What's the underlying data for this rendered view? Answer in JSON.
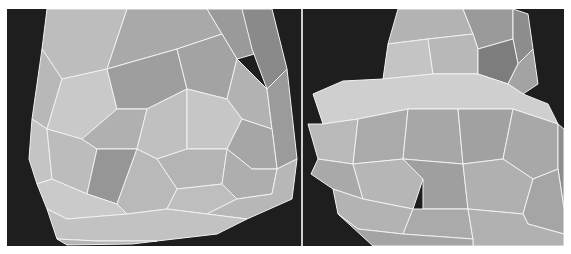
{
  "figure": {
    "background": "#1c1c1c",
    "divider_color": "#cfcfcf",
    "edge_color": "#f2f2f2",
    "panels": [
      {
        "id": "left",
        "description": "lower portion of a tapered polygonal mesh (wireframe over shaded facets)",
        "facets": [
          {
            "points": "40,0 120,0 100,60 55,70 35,40",
            "fill": "#bdbdbd"
          },
          {
            "points": "120,0 200,0 215,25 170,40 100,60",
            "fill": "#a9a9a9"
          },
          {
            "points": "200,0 255,0 265,40 230,50 215,25",
            "fill": "#9a9a9a"
          },
          {
            "points": "235,0 265,0 280,60 260,80 245,40",
            "fill": "#8a8a8a"
          },
          {
            "points": "35,40 55,70 40,120 25,110",
            "fill": "#b8b8b8"
          },
          {
            "points": "55,70 100,60 110,100 75,130 40,120",
            "fill": "#c9c9c9"
          },
          {
            "points": "100,60 170,40 180,80 140,100 110,100",
            "fill": "#9e9e9e"
          },
          {
            "points": "170,40 215,25 230,50 220,90 180,80",
            "fill": "#a3a3a3"
          },
          {
            "points": "230,50 260,80 265,120 235,110 220,90",
            "fill": "#b2b2b2"
          },
          {
            "points": "260,80 280,60 290,150 270,160 265,120",
            "fill": "#9b9b9b"
          },
          {
            "points": "25,110 40,120 45,170 30,175 22,150",
            "fill": "#c4c4c4"
          },
          {
            "points": "40,120 75,130 90,140 80,185 45,170",
            "fill": "#bcbcbc"
          },
          {
            "points": "75,130 110,100 140,100 130,140 90,140",
            "fill": "#b0b0b0"
          },
          {
            "points": "90,140 130,140 110,195 80,185",
            "fill": "#969696"
          },
          {
            "points": "130,140 140,100 180,80 180,140 150,150",
            "fill": "#c0c0c0"
          },
          {
            "points": "180,80 220,90 235,110 220,140 180,140",
            "fill": "#c6c6c6"
          },
          {
            "points": "235,110 265,120 270,160 245,160 220,140",
            "fill": "#a6a6a6"
          },
          {
            "points": "150,150 180,140 220,140 215,175 170,180",
            "fill": "#b4b4b4"
          },
          {
            "points": "220,140 245,160 270,160 265,185 230,190 215,175",
            "fill": "#aeaeae"
          },
          {
            "points": "110,195 130,140 150,150 170,180 160,200 120,205",
            "fill": "#b9b9b9"
          },
          {
            "points": "30,175 45,170 80,185 110,195 120,205 60,210 40,200",
            "fill": "#cacaca"
          },
          {
            "points": "160,200 170,180 215,175 230,190 200,205",
            "fill": "#bebebe"
          },
          {
            "points": "230,190 265,185 270,160 290,150 285,190 240,210 200,205",
            "fill": "#b7b7b7"
          },
          {
            "points": "40,200 60,210 120,205 160,200 200,205 240,210 210,225 150,232 90,232 50,230",
            "fill": "#c2c2c2"
          },
          {
            "points": "50,230 90,232 150,232 125,235 60,236",
            "fill": "#b5b5b5"
          }
        ]
      },
      {
        "id": "right",
        "description": "polygonal mesh of a bulbous lower section with narrower upper neck",
        "facets": [
          {
            "points": "95,0 160,0 170,25 125,30 85,35",
            "fill": "#b3b3b3"
          },
          {
            "points": "160,0 210,0 210,30 175,40 170,25",
            "fill": "#9a9a9a"
          },
          {
            "points": "210,0 225,5 230,40 215,55 210,30",
            "fill": "#8d8d8d"
          },
          {
            "points": "85,35 125,30 130,65 80,70",
            "fill": "#c4c4c4"
          },
          {
            "points": "125,30 170,25 175,40 175,65 130,65",
            "fill": "#b8b8b8"
          },
          {
            "points": "175,40 210,30 215,55 205,75 175,65",
            "fill": "#7d7d7d"
          },
          {
            "points": "215,55 230,40 235,75 220,85 205,75",
            "fill": "#a3a3a3"
          },
          {
            "points": "10,85 40,72 80,70 130,65 175,65 205,75 220,85 245,95 255,115 210,100 155,100 105,100 55,110 20,115",
            "fill": "#cfcfcf"
          },
          {
            "points": "5,115 20,115 55,110 50,155 15,150",
            "fill": "#b9b9b9"
          },
          {
            "points": "55,110 105,100 100,150 50,155",
            "fill": "#aaaaaa"
          },
          {
            "points": "105,100 155,100 160,155 100,150",
            "fill": "#a7a7a7"
          },
          {
            "points": "155,100 210,100 200,150 160,155",
            "fill": "#a1a1a1"
          },
          {
            "points": "210,100 255,115 255,160 230,170 200,150",
            "fill": "#a8a8a8"
          },
          {
            "points": "255,115 261,120 261,200 255,160",
            "fill": "#8e8e8e"
          },
          {
            "points": "15,150 50,155 60,190 30,180 8,165",
            "fill": "#a9a9a9"
          },
          {
            "points": "50,155 100,150 120,170 110,200 60,190",
            "fill": "#b6b6b6"
          },
          {
            "points": "100,150 160,155 165,200 120,200 120,170",
            "fill": "#9f9f9f"
          },
          {
            "points": "160,155 200,150 230,170 220,205 165,200",
            "fill": "#b0b0b0"
          },
          {
            "points": "230,170 255,160 261,200 261,225 225,215 220,205",
            "fill": "#a5a5a5"
          },
          {
            "points": "30,180 60,190 110,200 100,225 55,220 35,205",
            "fill": "#b3b3b3"
          },
          {
            "points": "110,200 120,200 165,200 170,230 100,225",
            "fill": "#aaaaaa"
          },
          {
            "points": "165,200 220,205 225,215 261,225 261,237 170,237 170,230",
            "fill": "#b1b1b1"
          },
          {
            "points": "35,205 55,220 100,225 170,230 170,237 70,237",
            "fill": "#a4a4a4"
          }
        ]
      }
    ]
  }
}
